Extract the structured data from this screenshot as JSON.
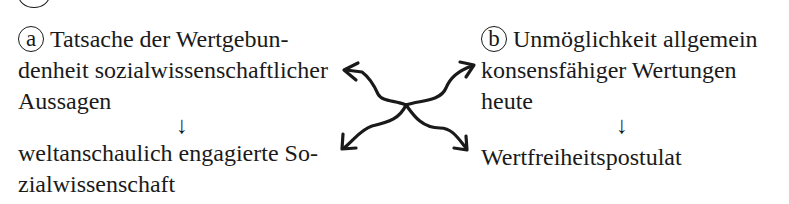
{
  "diagram": {
    "box_a": {
      "marker": "a",
      "lines": [
        "Tatsache der Wertgebun-",
        "denheit sozialwissenschaftlicher",
        "Aussagen"
      ]
    },
    "box_b": {
      "marker": "b",
      "lines": [
        "Unmöglichkeit allgemein",
        "konsensfähiger Wertungen",
        "heute"
      ]
    },
    "arrow_down": "↓",
    "result_a": {
      "lines": [
        "weltanschaulich engagierte So-",
        "zialwissenschaft"
      ]
    },
    "result_b": {
      "lines": [
        "Wertfreiheitspostulat"
      ]
    },
    "connector": "crossed wavy arrows linking a ↔ b and both results"
  }
}
